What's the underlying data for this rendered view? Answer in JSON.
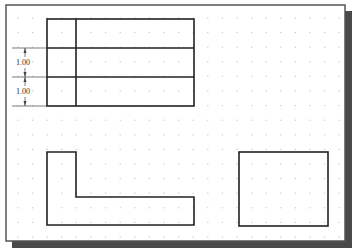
{
  "diagram": {
    "type": "cad-drawing-sheet",
    "colors": {
      "background": "#ffffff",
      "frame_stroke": "#555555",
      "frame_shadow": "#4a4a4a",
      "shape_stroke": "#222222",
      "grid_dot": "#c8c8c8",
      "dimension": "#444444"
    },
    "grid": {
      "spacing_px": 14.6,
      "origin_x": 18,
      "origin_y": 18
    },
    "dimensions": [
      {
        "label": "1.00",
        "from_y": 48,
        "to_y": 77
      },
      {
        "label": "1.00",
        "from_y": 77,
        "to_y": 106
      }
    ],
    "shapes": {
      "table": {
        "x": 47,
        "y": 19,
        "w": 147,
        "h": 87,
        "col_divider_x": 76,
        "row_lines_y": [
          48,
          77
        ]
      },
      "l_shape": {
        "points": "47,152 76,152 76,197 194,197 194,225 47,225"
      },
      "rectangle": {
        "x": 239,
        "y": 152,
        "w": 89,
        "h": 74
      }
    }
  }
}
